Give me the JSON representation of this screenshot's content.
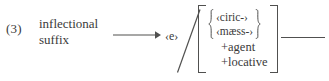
{
  "figure": {
    "example_number": "(3)",
    "lhs": {
      "line_1": "inflectional",
      "line_2": "suffix"
    },
    "arrow_icon": "long-rightwards-arrow-icon",
    "output_segment": "‹e›",
    "environment_slash": "slash-icon",
    "matrix": {
      "alternation": {
        "brace_icon": "curly-brace-icon",
        "options": [
          "‹ciric-›",
          "‹mæss-›"
        ]
      },
      "features": [
        "+agent",
        "+locative"
      ]
    },
    "environment_line": "horizontal-rule"
  },
  "colors": {
    "ink": "#3a3a3a",
    "rule": "#50504f",
    "background": "#ffffff"
  }
}
